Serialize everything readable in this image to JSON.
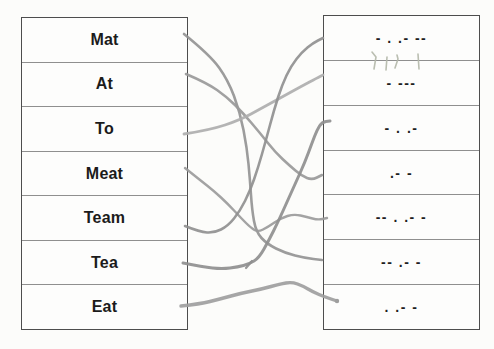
{
  "worksheet": {
    "type_hint": "morse-code-matching-exercise",
    "left_column": {
      "items": [
        "Mat",
        "At",
        "To",
        "Meat",
        "Team",
        "Tea",
        "Eat"
      ]
    },
    "right_column": {
      "items": [
        "- . .- --",
        "- ---",
        "- . .-",
        ".- -",
        "-- . .- -",
        "-- .- -",
        ". .- -"
      ]
    }
  },
  "connections": [
    {
      "from": "Mat",
      "from_index": 0,
      "to_index": 5,
      "to_morse": "-- .- -",
      "color": "#949494",
      "width": 2.6,
      "points": [
        [
          184,
          34
        ],
        [
          210,
          55
        ],
        [
          228,
          80
        ],
        [
          240,
          112
        ],
        [
          247,
          148
        ],
        [
          250,
          180
        ],
        [
          252,
          210
        ],
        [
          256,
          232
        ],
        [
          267,
          244
        ],
        [
          285,
          253
        ],
        [
          305,
          258
        ],
        [
          322,
          260
        ]
      ]
    },
    {
      "from": "At",
      "from_index": 1,
      "to_index": 3,
      "to_morse": ".- -",
      "color": "#999999",
      "width": 2.6,
      "points": [
        [
          186,
          74
        ],
        [
          207,
          83
        ],
        [
          227,
          97
        ],
        [
          243,
          113
        ],
        [
          260,
          133
        ],
        [
          275,
          152
        ],
        [
          290,
          166
        ],
        [
          302,
          176
        ],
        [
          312,
          180
        ],
        [
          322,
          175
        ]
      ]
    },
    {
      "from": "To",
      "from_index": 2,
      "to_index": 1,
      "to_morse": "- ---",
      "color": "#aeaeae",
      "width": 2.8,
      "points": [
        [
          184,
          134
        ],
        [
          210,
          130
        ],
        [
          240,
          120
        ],
        [
          262,
          108
        ],
        [
          282,
          97
        ],
        [
          302,
          86
        ],
        [
          317,
          78
        ],
        [
          323,
          75
        ]
      ]
    },
    {
      "from": "Meat",
      "from_index": 3,
      "to_index": 4,
      "to_morse": "-- . .- -",
      "color": "#9b9b9b",
      "width": 2.4,
      "points": [
        [
          185,
          168
        ],
        [
          200,
          180
        ],
        [
          214,
          191
        ],
        [
          228,
          204
        ],
        [
          241,
          218
        ],
        [
          251,
          228
        ],
        [
          258,
          232
        ],
        [
          268,
          227
        ],
        [
          281,
          218
        ],
        [
          294,
          214
        ],
        [
          307,
          217
        ],
        [
          318,
          220
        ],
        [
          327,
          218
        ]
      ]
    },
    {
      "from": "Team",
      "from_index": 4,
      "to_index": 0,
      "to_morse": "- . .- --",
      "color": "#909090",
      "width": 2.6,
      "points": [
        [
          185,
          226
        ],
        [
          200,
          232
        ],
        [
          214,
          233
        ],
        [
          228,
          226
        ],
        [
          240,
          211
        ],
        [
          250,
          191
        ],
        [
          258,
          168
        ],
        [
          266,
          140
        ],
        [
          274,
          110
        ],
        [
          282,
          85
        ],
        [
          291,
          66
        ],
        [
          302,
          52
        ],
        [
          313,
          43
        ],
        [
          323,
          38
        ]
      ]
    },
    {
      "from": "Tea",
      "from_index": 5,
      "to_index": 2,
      "to_morse": "- . .-",
      "color": "#8f8f8f",
      "width": 3.0,
      "points": [
        [
          183,
          263
        ],
        [
          203,
          267
        ],
        [
          222,
          269
        ],
        [
          238,
          267
        ],
        [
          249,
          264
        ],
        [
          259,
          258
        ],
        [
          269,
          240
        ],
        [
          278,
          222
        ],
        [
          287,
          202
        ],
        [
          296,
          182
        ],
        [
          305,
          162
        ],
        [
          312,
          143
        ],
        [
          317,
          130
        ],
        [
          322,
          122
        ],
        [
          330,
          121
        ]
      ]
    },
    {
      "from": "Eat",
      "from_index": 6,
      "to_index": 6,
      "to_morse": ". .- -",
      "color": "#9e9e9e",
      "width": 3.4,
      "points": [
        [
          181,
          306
        ],
        [
          200,
          304
        ],
        [
          220,
          299
        ],
        [
          242,
          293
        ],
        [
          262,
          289
        ],
        [
          280,
          284
        ],
        [
          292,
          282
        ],
        [
          303,
          286
        ],
        [
          313,
          292
        ],
        [
          325,
          297
        ],
        [
          337,
          301
        ]
      ]
    }
  ],
  "pencil_marks": {
    "description": "faint tally ticks under first morse cell",
    "color": "#b4b8aa",
    "width": 1.6,
    "strokes": [
      [
        [
          372,
          52
        ],
        [
          376,
          57
        ],
        [
          374,
          69
        ]
      ],
      [
        [
          387,
          57
        ],
        [
          386,
          70
        ]
      ],
      [
        [
          397,
          55
        ],
        [
          398,
          59
        ],
        [
          395,
          68
        ]
      ],
      [
        [
          418,
          54
        ],
        [
          419,
          69
        ]
      ]
    ],
    "spur": {
      "color": "#8f8f8f",
      "width": 2.2,
      "points": [
        [
          252,
          261
        ],
        [
          246,
          268
        ]
      ]
    },
    "end_dot": {
      "x": 337,
      "y": 301,
      "r": 2.2,
      "color": "#9e9e9e"
    }
  },
  "style": {
    "page_background": "#fcfcfa",
    "table_border": "#4d4d4d",
    "row_divider": "#8f8f8f",
    "text_color": "#1b1b1b",
    "line_opacity": 0.92
  }
}
